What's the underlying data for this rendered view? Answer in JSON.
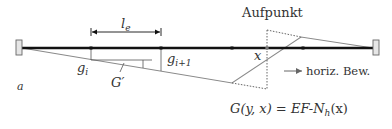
{
  "diagram": {
    "title_label": "Aufpunkt",
    "labels": {
      "element_length": "l",
      "element_length_sub": "e",
      "g_i": "g",
      "g_i_sub": "i",
      "g_i1": "g",
      "g_i1_sub": "i+1",
      "g_prime": "G′",
      "x": "x",
      "a": "a",
      "direction": "horiz. Bew.",
      "formula": "G(y, x) = EF-N",
      "formula_sub": "h",
      "formula_tail": "(x)"
    },
    "colors": {
      "beam": "#111111",
      "influence_line": "#8a8a8a",
      "dotted": "#555555",
      "support_fill": "#e6e6e6",
      "support_stroke": "#666666",
      "text": "#333333"
    }
  }
}
